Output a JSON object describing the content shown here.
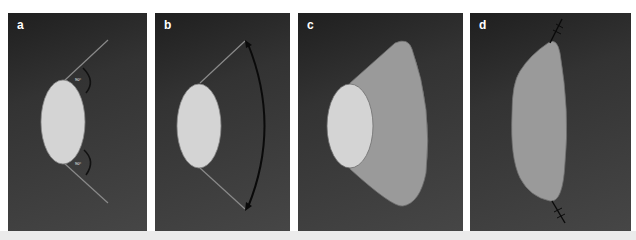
{
  "figure": {
    "panels": [
      {
        "label": "a",
        "angle_top": "90°",
        "angle_bottom": "90°"
      },
      {
        "label": "b"
      },
      {
        "label": "c"
      },
      {
        "label": "d"
      }
    ]
  },
  "colors": {
    "background": "#3a3a3a",
    "ellipse_fill": "#d4d4d4",
    "flap_fill": "#9a9a9a",
    "guide_line": "#8a8a8a",
    "arrow": "#0a0a0a",
    "page_strip": "#ebebeb"
  }
}
